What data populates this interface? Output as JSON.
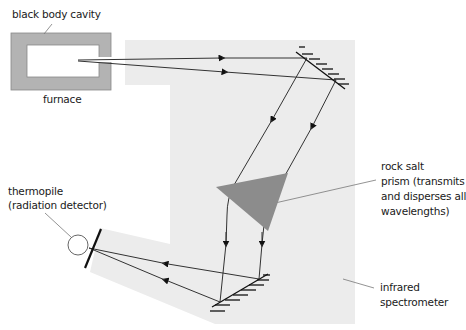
{
  "labels": {
    "black_body_cavity": "black body cavity",
    "furnace": "furnace",
    "rock_salt_prism_line1": "rock salt",
    "rock_salt_prism_line2": "prism (transmits",
    "rock_salt_prism_line3": "and disperses all",
    "rock_salt_prism_line4": "wavelengths)",
    "thermopile_line1": "thermopile",
    "thermopile_line2": "(radiation detector)",
    "infrared_line1": "infrared",
    "infrared_line2": "spectrometer"
  },
  "colors": {
    "spectrometer_bg": "#ececec",
    "furnace_wall": "#b3b3b3",
    "prism": "#8c8c8c",
    "ray": "#333333",
    "leader": "#777777"
  }
}
